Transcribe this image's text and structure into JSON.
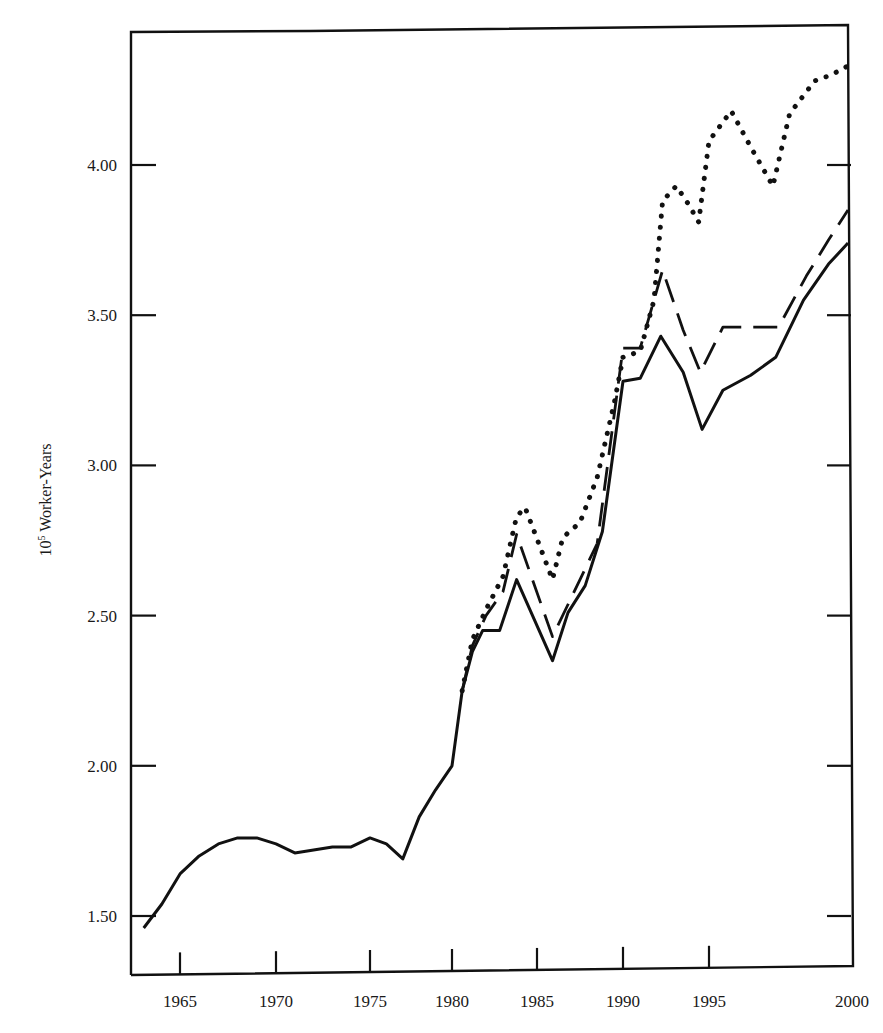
{
  "chart_data": {
    "type": "line",
    "title": "",
    "xlabel": "",
    "ylabel": "10^5 Worker-Years",
    "ylabel_base": "10",
    "ylabel_sup": "5",
    "ylabel_rest": " Worker-Years",
    "xlim": [
      1963,
      2000
    ],
    "ylim": [
      1.3,
      4.5
    ],
    "grid": false,
    "legend": "none",
    "x_ticks": [
      1965,
      1970,
      1975,
      1980,
      1985,
      1990,
      1995,
      2000
    ],
    "x_tick_labels": [
      "1965",
      "1970",
      "1975",
      "1980",
      "1985",
      "1990",
      "1995",
      "2000"
    ],
    "y_ticks": [
      1.5,
      2.0,
      2.5,
      3.0,
      3.5,
      4.0
    ],
    "y_tick_labels": [
      "1.50",
      "2.00",
      "2.50",
      "3.00",
      "3.50",
      "4.00"
    ],
    "series": [
      {
        "name": "solid",
        "style": "solid",
        "x": [
          1963,
          1964,
          1965,
          1966,
          1967,
          1968,
          1969,
          1970,
          1971,
          1972,
          1973,
          1974,
          1975,
          1976,
          1977,
          1978,
          1979,
          1980,
          1980.6,
          1981.2,
          1981.8,
          1982.8,
          1983.8,
          1985.9,
          1986.8,
          1987.8,
          1988.8,
          1990,
          1991,
          1992.2,
          1993.5,
          1994.6,
          1995.5,
          1996.5,
          1997.4,
          1998.4,
          1999.3,
          2000
        ],
        "values": [
          1.46,
          1.54,
          1.64,
          1.7,
          1.74,
          1.76,
          1.76,
          1.74,
          1.71,
          1.72,
          1.73,
          1.73,
          1.76,
          1.74,
          1.69,
          1.83,
          1.92,
          2.0,
          2.25,
          2.38,
          2.45,
          2.45,
          2.62,
          2.35,
          2.51,
          2.6,
          2.78,
          3.28,
          3.29,
          3.43,
          3.31,
          3.12,
          3.25,
          3.3,
          3.36,
          3.55,
          3.67,
          3.74
        ]
      },
      {
        "name": "dashed",
        "style": "dashed",
        "x": [
          1980.6,
          1981.2,
          1982.0,
          1983.0,
          1983.8,
          1985.9,
          1987.5,
          1988.5,
          1990,
          1991,
          1992.3,
          1993.5,
          1994.5,
          1995.5,
          1996.5,
          1997.5,
          1998.5,
          1999.3,
          2000
        ],
        "values": [
          2.25,
          2.4,
          2.5,
          2.58,
          2.77,
          2.43,
          2.62,
          2.74,
          3.39,
          3.39,
          3.65,
          3.45,
          3.31,
          3.46,
          3.46,
          3.46,
          3.63,
          3.75,
          3.85
        ]
      },
      {
        "name": "dotted",
        "style": "dotted",
        "x": [
          1980.6,
          1981.2,
          1982.0,
          1983.0,
          1983.8,
          1984.3,
          1985.9,
          1986.5,
          1987.5,
          1988.5,
          1989.5,
          1990,
          1991,
          1991.8,
          1992.3,
          1993.1,
          1993.8,
          1994.4,
          1995.0,
          1995.8,
          1996.5,
          1997.3,
          1997.9,
          1998.8,
          1999.4,
          2000
        ],
        "values": [
          2.25,
          2.42,
          2.52,
          2.63,
          2.83,
          2.86,
          2.62,
          2.76,
          2.81,
          2.96,
          3.21,
          3.36,
          3.38,
          3.55,
          3.88,
          3.93,
          3.87,
          3.81,
          4.08,
          4.18,
          4.06,
          3.93,
          4.17,
          4.28,
          4.3,
          4.33
        ]
      }
    ]
  }
}
